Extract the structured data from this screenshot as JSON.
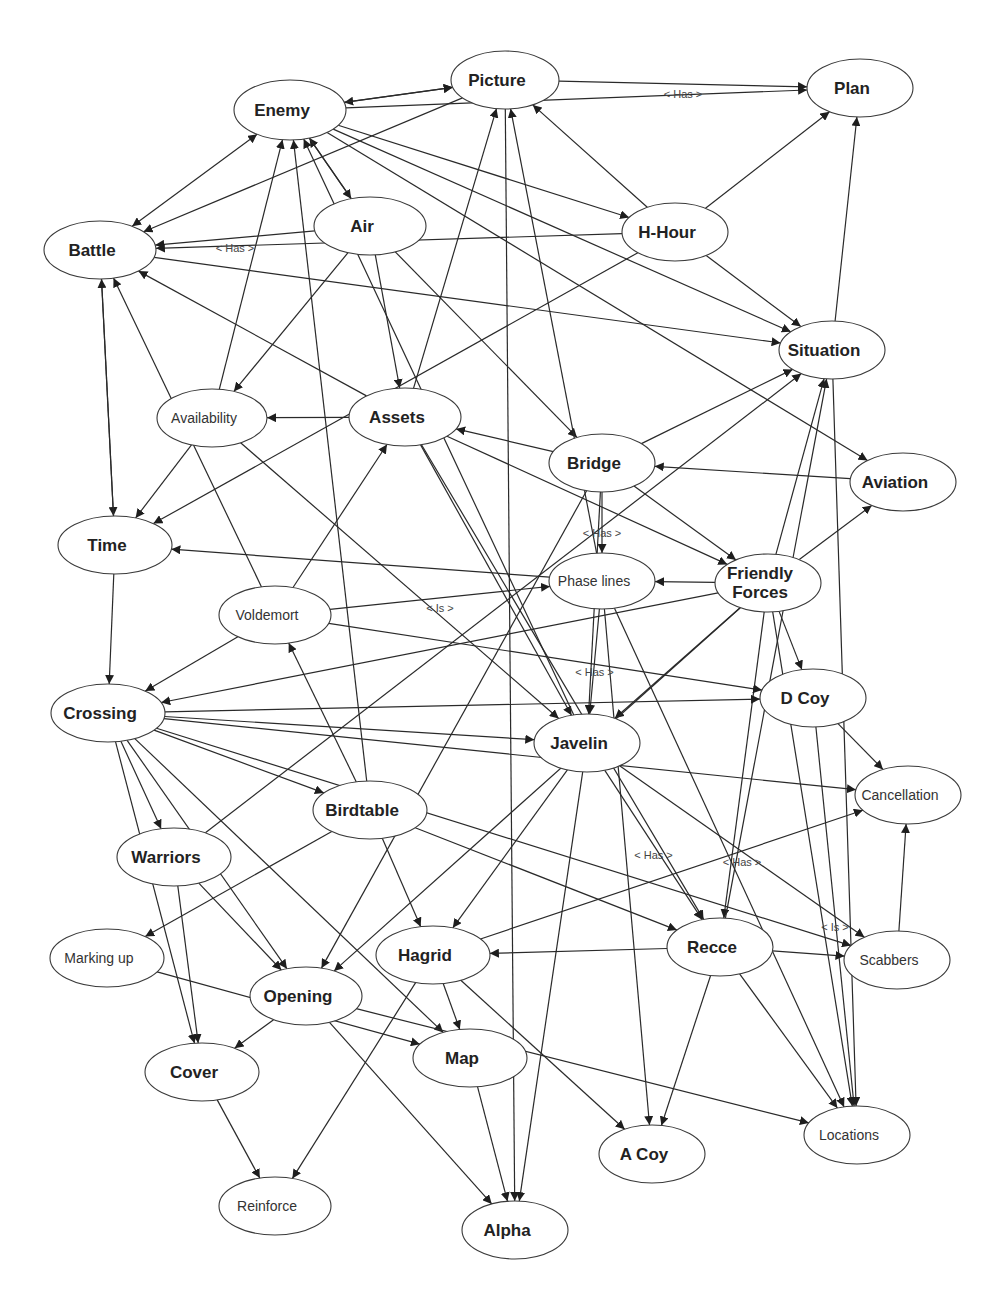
{
  "diagram": {
    "type": "directed-concept-map",
    "nodes": [
      {
        "id": "enemy",
        "label": "Enemy",
        "x": 290,
        "y": 110,
        "rx": 56,
        "ry": 30,
        "style": "bold"
      },
      {
        "id": "picture",
        "label": "Picture",
        "x": 505,
        "y": 80,
        "rx": 54,
        "ry": 29,
        "style": "bold"
      },
      {
        "id": "plan",
        "label": "Plan",
        "x": 860,
        "y": 88,
        "rx": 53,
        "ry": 29,
        "style": "bold"
      },
      {
        "id": "battle",
        "label": "Battle",
        "x": 100,
        "y": 250,
        "rx": 56,
        "ry": 29,
        "style": "bold"
      },
      {
        "id": "air",
        "label": "Air",
        "x": 370,
        "y": 226,
        "rx": 56,
        "ry": 29,
        "style": "bold"
      },
      {
        "id": "h-hour",
        "label": "H-Hour",
        "x": 675,
        "y": 232,
        "rx": 53,
        "ry": 29,
        "style": "bold"
      },
      {
        "id": "situation",
        "label": "Situation",
        "x": 832,
        "y": 350,
        "rx": 53,
        "ry": 29,
        "style": "bold"
      },
      {
        "id": "availability",
        "label": "Availability",
        "x": 212,
        "y": 418,
        "rx": 55,
        "ry": 29,
        "style": "light"
      },
      {
        "id": "assets",
        "label": "Assets",
        "x": 405,
        "y": 417,
        "rx": 56,
        "ry": 29,
        "style": "bold"
      },
      {
        "id": "bridge",
        "label": "Bridge",
        "x": 602,
        "y": 463,
        "rx": 53,
        "ry": 29,
        "style": "bold"
      },
      {
        "id": "aviation",
        "label": "Aviation",
        "x": 903,
        "y": 482,
        "rx": 53,
        "ry": 29,
        "style": "bold"
      },
      {
        "id": "time",
        "label": "Time",
        "x": 115,
        "y": 545,
        "rx": 57,
        "ry": 29,
        "style": "bold"
      },
      {
        "id": "phase-lines",
        "label": "Phase lines",
        "x": 602,
        "y": 581,
        "rx": 53,
        "ry": 28,
        "style": "light"
      },
      {
        "id": "friendly-forces",
        "label": "Friendly\nForces",
        "x": 768,
        "y": 583,
        "rx": 53,
        "ry": 29,
        "style": "bold"
      },
      {
        "id": "voldemort",
        "label": "Voldemort",
        "x": 275,
        "y": 615,
        "rx": 56,
        "ry": 29,
        "style": "light"
      },
      {
        "id": "crossing",
        "label": "Crossing",
        "x": 108,
        "y": 713,
        "rx": 57,
        "ry": 29,
        "style": "bold"
      },
      {
        "id": "d-coy",
        "label": "D Coy",
        "x": 813,
        "y": 698,
        "rx": 53,
        "ry": 29,
        "style": "bold"
      },
      {
        "id": "javelin",
        "label": "Javelin",
        "x": 587,
        "y": 743,
        "rx": 53,
        "ry": 29,
        "style": "bold"
      },
      {
        "id": "cancellation",
        "label": "Cancellation",
        "x": 908,
        "y": 795,
        "rx": 53,
        "ry": 29,
        "style": "light"
      },
      {
        "id": "birdtable",
        "label": "Birdtable",
        "x": 370,
        "y": 810,
        "rx": 57,
        "ry": 29,
        "style": "bold"
      },
      {
        "id": "warriors",
        "label": "Warriors",
        "x": 174,
        "y": 857,
        "rx": 57,
        "ry": 29,
        "style": "bold"
      },
      {
        "id": "marking-up",
        "label": "Marking up",
        "x": 107,
        "y": 958,
        "rx": 57,
        "ry": 29,
        "style": "light"
      },
      {
        "id": "hagrid",
        "label": "Hagrid",
        "x": 433,
        "y": 955,
        "rx": 57,
        "ry": 29,
        "style": "bold"
      },
      {
        "id": "recce",
        "label": "Recce",
        "x": 720,
        "y": 947,
        "rx": 53,
        "ry": 29,
        "style": "bold"
      },
      {
        "id": "scabbers",
        "label": "Scabbers",
        "x": 897,
        "y": 960,
        "rx": 53,
        "ry": 29,
        "style": "light"
      },
      {
        "id": "opening",
        "label": "Opening",
        "x": 306,
        "y": 996,
        "rx": 56,
        "ry": 29,
        "style": "bold"
      },
      {
        "id": "cover",
        "label": "Cover",
        "x": 202,
        "y": 1072,
        "rx": 57,
        "ry": 29,
        "style": "bold"
      },
      {
        "id": "map",
        "label": "Map",
        "x": 470,
        "y": 1058,
        "rx": 57,
        "ry": 29,
        "style": "bold"
      },
      {
        "id": "a-coy",
        "label": "A Coy",
        "x": 652,
        "y": 1154,
        "rx": 53,
        "ry": 29,
        "style": "bold"
      },
      {
        "id": "locations",
        "label": "Locations",
        "x": 857,
        "y": 1135,
        "rx": 53,
        "ry": 29,
        "style": "light"
      },
      {
        "id": "reinforce",
        "label": "Reinforce",
        "x": 275,
        "y": 1206,
        "rx": 56,
        "ry": 29,
        "style": "light"
      },
      {
        "id": "alpha",
        "label": "Alpha",
        "x": 515,
        "y": 1230,
        "rx": 53,
        "ry": 29,
        "style": "bold"
      }
    ],
    "edges": [
      {
        "from": "enemy",
        "to": "picture",
        "bidir": true
      },
      {
        "from": "enemy",
        "to": "picture"
      },
      {
        "from": "picture",
        "to": "plan",
        "label": "< Has >"
      },
      {
        "from": "enemy",
        "to": "plan"
      },
      {
        "from": "enemy",
        "to": "battle",
        "bidir": true
      },
      {
        "from": "picture",
        "to": "battle"
      },
      {
        "from": "enemy",
        "to": "h-hour"
      },
      {
        "from": "enemy",
        "to": "situation"
      },
      {
        "from": "enemy",
        "to": "aviation"
      },
      {
        "from": "air",
        "to": "enemy"
      },
      {
        "from": "enemy",
        "to": "air"
      },
      {
        "from": "air",
        "to": "battle",
        "label": "< Has >"
      },
      {
        "from": "air",
        "to": "assets"
      },
      {
        "from": "air",
        "to": "bridge"
      },
      {
        "from": "air",
        "to": "availability"
      },
      {
        "from": "h-hour",
        "to": "battle"
      },
      {
        "from": "h-hour",
        "to": "picture"
      },
      {
        "from": "h-hour",
        "to": "plan"
      },
      {
        "from": "h-hour",
        "to": "situation"
      },
      {
        "from": "h-hour",
        "to": "time"
      },
      {
        "from": "situation",
        "to": "plan"
      },
      {
        "from": "battle",
        "to": "situation"
      },
      {
        "from": "battle",
        "to": "time"
      },
      {
        "from": "time",
        "to": "battle"
      },
      {
        "from": "time",
        "to": "crossing"
      },
      {
        "from": "availability",
        "to": "enemy"
      },
      {
        "from": "availability",
        "to": "time"
      },
      {
        "from": "availability",
        "to": "javelin"
      },
      {
        "from": "assets",
        "to": "battle"
      },
      {
        "from": "assets",
        "to": "picture"
      },
      {
        "from": "assets",
        "to": "availability"
      },
      {
        "from": "assets",
        "to": "friendly-forces"
      },
      {
        "from": "assets",
        "to": "javelin"
      },
      {
        "from": "assets",
        "to": "recce"
      },
      {
        "from": "bridge",
        "to": "assets"
      },
      {
        "from": "bridge",
        "to": "phase-lines",
        "label": "< Has >"
      },
      {
        "from": "bridge",
        "to": "friendly-forces"
      },
      {
        "from": "bridge",
        "to": "javelin"
      },
      {
        "from": "bridge",
        "to": "situation"
      },
      {
        "from": "bridge",
        "to": "opening"
      },
      {
        "from": "aviation",
        "to": "bridge"
      },
      {
        "from": "friendly-forces",
        "to": "aviation"
      },
      {
        "from": "friendly-forces",
        "to": "situation"
      },
      {
        "from": "friendly-forces",
        "to": "d-coy"
      },
      {
        "from": "friendly-forces",
        "to": "phase-lines"
      },
      {
        "from": "friendly-forces",
        "to": "javelin"
      },
      {
        "from": "friendly-forces",
        "to": "recce"
      },
      {
        "from": "friendly-forces",
        "to": "locations"
      },
      {
        "from": "friendly-forces",
        "to": "opening"
      },
      {
        "from": "friendly-forces",
        "to": "crossing"
      },
      {
        "from": "phase-lines",
        "to": "time"
      },
      {
        "from": "phase-lines",
        "to": "picture"
      },
      {
        "from": "phase-lines",
        "to": "javelin",
        "label": "< Has >"
      },
      {
        "from": "phase-lines",
        "to": "a-coy"
      },
      {
        "from": "phase-lines",
        "to": "locations"
      },
      {
        "from": "voldemort",
        "to": "battle"
      },
      {
        "from": "voldemort",
        "to": "phase-lines",
        "label": "< Is >"
      },
      {
        "from": "voldemort",
        "to": "assets"
      },
      {
        "from": "voldemort",
        "to": "crossing"
      },
      {
        "from": "voldemort",
        "to": "d-coy"
      },
      {
        "from": "crossing",
        "to": "d-coy"
      },
      {
        "from": "crossing",
        "to": "javelin"
      },
      {
        "from": "crossing",
        "to": "birdtable"
      },
      {
        "from": "crossing",
        "to": "warriors"
      },
      {
        "from": "crossing",
        "to": "cover"
      },
      {
        "from": "crossing",
        "to": "opening"
      },
      {
        "from": "crossing",
        "to": "cancellation"
      },
      {
        "from": "crossing",
        "to": "scabbers"
      },
      {
        "from": "crossing",
        "to": "map"
      },
      {
        "from": "d-coy",
        "to": "cancellation"
      },
      {
        "from": "d-coy",
        "to": "locations",
        "label": "< Is >"
      },
      {
        "from": "javelin",
        "to": "enemy"
      },
      {
        "from": "javelin",
        "to": "scabbers",
        "label": "< Has >"
      },
      {
        "from": "javelin",
        "to": "recce",
        "label": "< Has >"
      },
      {
        "from": "javelin",
        "to": "alpha"
      },
      {
        "from": "javelin",
        "to": "hagrid"
      },
      {
        "from": "scabbers",
        "to": "cancellation"
      },
      {
        "from": "birdtable",
        "to": "voldemort"
      },
      {
        "from": "birdtable",
        "to": "hagrid"
      },
      {
        "from": "birdtable",
        "to": "recce"
      },
      {
        "from": "birdtable",
        "to": "marking-up"
      },
      {
        "from": "birdtable",
        "to": "enemy"
      },
      {
        "from": "warriors",
        "to": "opening"
      },
      {
        "from": "warriors",
        "to": "situation"
      },
      {
        "from": "warriors",
        "to": "cover"
      },
      {
        "from": "hagrid",
        "to": "map"
      },
      {
        "from": "hagrid",
        "to": "reinforce"
      },
      {
        "from": "hagrid",
        "to": "cancellation"
      },
      {
        "from": "hagrid",
        "to": "a-coy"
      },
      {
        "from": "recce",
        "to": "hagrid"
      },
      {
        "from": "recce",
        "to": "scabbers"
      },
      {
        "from": "recce",
        "to": "a-coy"
      },
      {
        "from": "recce",
        "to": "locations"
      },
      {
        "from": "recce",
        "to": "situation"
      },
      {
        "from": "marking-up",
        "to": "map"
      },
      {
        "from": "opening",
        "to": "cover"
      },
      {
        "from": "opening",
        "to": "alpha"
      },
      {
        "from": "opening",
        "to": "locations"
      },
      {
        "from": "cover",
        "to": "reinforce"
      },
      {
        "from": "map",
        "to": "alpha"
      },
      {
        "from": "picture",
        "to": "alpha"
      },
      {
        "from": "situation",
        "to": "locations"
      }
    ],
    "stroke_color": "#2a2a2a",
    "background": "#ffffff"
  }
}
